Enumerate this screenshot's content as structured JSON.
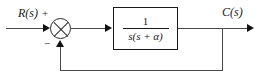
{
  "diagram": {
    "type": "control-system-block-diagram",
    "background_color": "#ffffff",
    "line_color": "#4a4a4a",
    "ink_color": "#1a1a1a",
    "input": {
      "label": "R(s)",
      "sign": "+"
    },
    "summing_junction": {
      "name": "summing-junction",
      "glyph": "circle-with-x",
      "feedback_sign": "−"
    },
    "plant": {
      "name": "transfer-function-block",
      "numerator": "1",
      "denominator": "s(s + α)",
      "expression": "1 / (s(s + α))"
    },
    "output": {
      "label": "C(s)"
    },
    "feedback": {
      "name": "unity-feedback-path",
      "gain": "1",
      "polarity": "negative"
    }
  }
}
